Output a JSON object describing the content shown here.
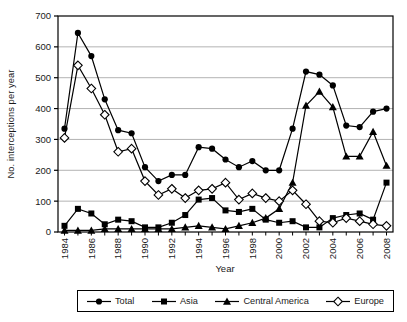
{
  "chart_data": {
    "type": "line",
    "title": "",
    "xlabel": "Year",
    "ylabel": "No. interceptions per year",
    "x": [
      1984,
      1985,
      1986,
      1987,
      1988,
      1989,
      1990,
      1991,
      1992,
      1993,
      1994,
      1995,
      1996,
      1997,
      1998,
      1999,
      2000,
      2001,
      2002,
      2003,
      2004,
      2005,
      2006,
      2007,
      2008
    ],
    "xticks": [
      1984,
      1986,
      1988,
      1990,
      1992,
      1994,
      1996,
      1998,
      2000,
      2002,
      2004,
      2006,
      2008
    ],
    "ylim": [
      0,
      700
    ],
    "yticks": [
      0,
      100,
      200,
      300,
      400,
      500,
      600,
      700
    ],
    "grid": "horizontal",
    "legend_position": "bottom-center-boxed",
    "series": [
      {
        "name": "Total",
        "marker": "circle-filled",
        "values": [
          335,
          645,
          570,
          430,
          330,
          320,
          210,
          165,
          185,
          185,
          275,
          270,
          235,
          210,
          230,
          200,
          200,
          335,
          520,
          510,
          475,
          345,
          340,
          390,
          400
        ]
      },
      {
        "name": "Asia",
        "marker": "square-filled",
        "values": [
          20,
          75,
          60,
          25,
          40,
          35,
          15,
          15,
          30,
          55,
          105,
          110,
          70,
          65,
          75,
          40,
          30,
          35,
          15,
          15,
          45,
          55,
          60,
          40,
          160
        ]
      },
      {
        "name": "Central America",
        "marker": "triangle-filled",
        "values": [
          5,
          5,
          5,
          10,
          10,
          10,
          10,
          10,
          10,
          15,
          20,
          15,
          10,
          20,
          30,
          45,
          75,
          160,
          410,
          455,
          405,
          245,
          245,
          325,
          215
        ]
      },
      {
        "name": "Europe",
        "marker": "diamond-open",
        "values": [
          305,
          540,
          465,
          380,
          260,
          270,
          165,
          120,
          140,
          110,
          135,
          140,
          160,
          105,
          125,
          110,
          100,
          135,
          90,
          35,
          30,
          45,
          35,
          25,
          20
        ]
      }
    ]
  },
  "colors": {
    "series": "#000000",
    "grid": "#b3b3b3",
    "frame": "#000000",
    "background": "#ffffff",
    "text": "#1a1a1a",
    "open_marker_fill": "#ffffff"
  }
}
